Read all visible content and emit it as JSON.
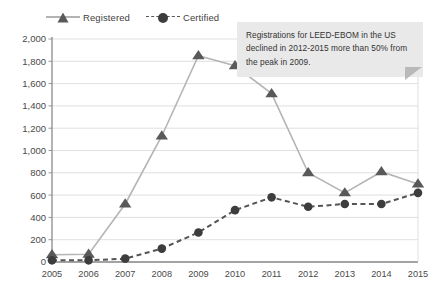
{
  "chart_data": {
    "type": "line",
    "title": "",
    "subtitle": "",
    "xlabel": "",
    "ylabel": "",
    "categories": [
      "2005",
      "2006",
      "2007",
      "2008",
      "2009",
      "2010",
      "2011",
      "2012",
      "2013",
      "2014",
      "2015"
    ],
    "x": [
      2005,
      2006,
      2007,
      2008,
      2009,
      2010,
      2011,
      2012,
      2013,
      2014,
      2015
    ],
    "series": [
      {
        "name": "Registered",
        "marker": "triangle",
        "line_style": "solid",
        "color": "#b5b5b5",
        "marker_color": "#595959",
        "values": [
          65,
          70,
          520,
          1130,
          1850,
          1760,
          1510,
          800,
          620,
          810,
          700
        ]
      },
      {
        "name": "Certified",
        "marker": "circle",
        "line_style": "dashed",
        "color": "#555555",
        "marker_color": "#3d3d3d",
        "values": [
          15,
          15,
          30,
          120,
          265,
          465,
          580,
          495,
          520,
          520,
          620
        ]
      }
    ],
    "ylim": [
      0,
      2000
    ],
    "ytick_step": 200,
    "yticks": [
      0,
      200,
      400,
      600,
      800,
      1000,
      1200,
      1400,
      1600,
      1800,
      2000
    ],
    "ytick_labels": [
      "0",
      "200",
      "400",
      "600",
      "800",
      "1,000",
      "1,200",
      "1,400",
      "1,600",
      "1,800",
      "2,000"
    ],
    "grid": true,
    "grid_axis": "y",
    "legend_position": "top-left",
    "annotations": [
      {
        "text": "Registrations for LEED-EBOM in the US declined in 2012-2015 more than 50% from the peak in 2009.",
        "position": "top-right",
        "background": "#e9e9e9"
      }
    ]
  },
  "legend": {
    "registered_label": "Registered",
    "certified_label": "Certified"
  },
  "callout": {
    "text": "Registrations for LEED-EBOM in the US declined in 2012-2015 more than 50% from the peak in 2009."
  },
  "colors": {
    "registered_line": "#b5b5b5",
    "registered_marker": "#595959",
    "certified_line": "#555555",
    "certified_marker": "#3d3d3d",
    "grid": "#d8d8d8",
    "axis": "#8a8a8a",
    "text": "#3f3f3f",
    "callout_bg": "#e9e9e9"
  }
}
